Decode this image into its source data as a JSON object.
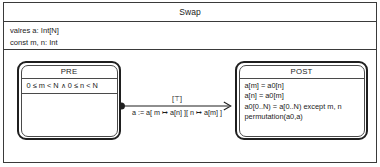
{
  "diagram": {
    "title": "Swap",
    "declarations": [
      "valres a: Int[N]",
      "const m, n: Int"
    ],
    "states": [
      {
        "name": "PRE",
        "lines": [
          "0 ≤ m < N ∧ 0 ≤ n < N"
        ]
      },
      {
        "name": "POST",
        "lines": [
          "a[m] = a0[n]",
          "a[n] = a0[m]",
          "a0[0..N) = a[0..N) except m, n",
          "permutation(a0,a)"
        ]
      }
    ],
    "transition": {
      "guard": "[⊤]",
      "action": "a := a[ m ↦ a[n] ][ n ↦ a[m] ]",
      "source_marker": "filled-circle",
      "target_marker": "open-arrowhead"
    },
    "colors": {
      "line": "#1f1f1f",
      "text": "#1b1b1b",
      "background": "#ffffff",
      "inner_line": "#4a4a4a"
    }
  }
}
